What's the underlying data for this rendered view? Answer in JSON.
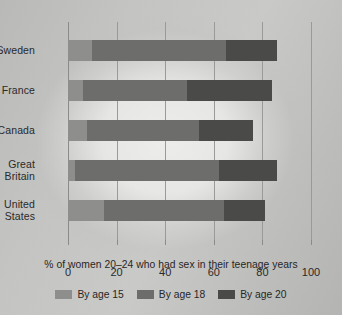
{
  "chart_data": {
    "type": "bar",
    "orientation": "horizontal",
    "stacked": true,
    "title": "",
    "xlabel": "% of women 20–24 who had sex in their teenage years",
    "ylabel": "",
    "xlim": [
      0,
      100
    ],
    "grid": true,
    "legend_position": "bottom",
    "categories": [
      "Sweden",
      "France",
      "Canada",
      "Great Britain",
      "United States"
    ],
    "xticks": [
      0,
      20,
      40,
      60,
      80,
      100
    ],
    "series": [
      {
        "name": "By age 15",
        "color": "#8e8e8c",
        "values": [
          10,
          6,
          8,
          3,
          15
        ]
      },
      {
        "name": "By age 18",
        "color": "#6d6d6b",
        "values": [
          55,
          43,
          46,
          59,
          49
        ]
      },
      {
        "name": "By age 20",
        "color": "#4a4a49",
        "values": [
          21,
          35,
          22,
          24,
          17
        ]
      }
    ],
    "cumulative_totals": [
      86,
      84,
      76,
      86,
      81
    ],
    "cumulative_by_series": {
      "By age 15": [
        10,
        6,
        8,
        3,
        15
      ],
      "By age 18": [
        65,
        49,
        54,
        62,
        64
      ],
      "By age 20": [
        86,
        84,
        76,
        86,
        81
      ]
    }
  },
  "axis": {
    "caption": "% of women 20–24 who had sex in their teenage years",
    "tick_labels": [
      "0",
      "20",
      "40",
      "60",
      "80",
      "100"
    ],
    "category_labels": [
      {
        "line1": "Sweden",
        "line2": ""
      },
      {
        "line1": "France",
        "line2": ""
      },
      {
        "line1": "Canada",
        "line2": ""
      },
      {
        "line1": "Great",
        "line2": "Britain"
      },
      {
        "line1": "United",
        "line2": "States"
      }
    ]
  },
  "legend": {
    "items": [
      {
        "label": "By age 15",
        "color": "#8e8e8c"
      },
      {
        "label": "By age 18",
        "color": "#6d6d6b"
      },
      {
        "label": "By age 20",
        "color": "#4a4a49"
      }
    ]
  }
}
